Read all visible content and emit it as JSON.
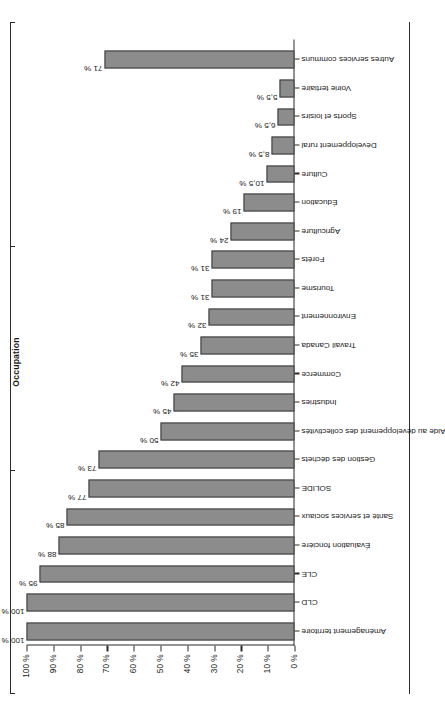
{
  "chart_data": {
    "type": "bar",
    "title": "Occupation",
    "xlabel": "",
    "ylabel": "",
    "ylim": [
      0,
      100
    ],
    "grid": false,
    "legend": "none",
    "orientation": "vertical-bars-on-rotated-page",
    "value_suffix": " %",
    "ytick_labels": [
      "0 %",
      "10 %",
      "20 %",
      "30 %",
      "40 %",
      "50 %",
      "60 %",
      "70 %",
      "80 %",
      "90 %",
      "100 %"
    ],
    "ytick_values": [
      0,
      10,
      20,
      30,
      40,
      50,
      60,
      70,
      80,
      90,
      100
    ],
    "categories": [
      "Aménagement territoire",
      "CLD",
      "CLE",
      "Évaluation foncière",
      "Santé et services sociaux",
      "SOLIDE",
      "Gestion des déchets",
      "Aide au développement des collectivités",
      "Industries",
      "Commerce",
      "Travail Canada",
      "Environnement",
      "Tourisme",
      "Forêts",
      "Agriculture",
      "Éducation",
      "Culture",
      "Développement rural",
      "Sports et loisirs",
      "Voirie tertiaire",
      "Autres services communs"
    ],
    "values": [
      100,
      100,
      95,
      88,
      85,
      77,
      73,
      50,
      45,
      42,
      35,
      32,
      31,
      31,
      24,
      19,
      10.5,
      8.5,
      6.5,
      5.5,
      71
    ],
    "value_labels": [
      "100 %",
      "100 %",
      "95 %",
      "88 %",
      "85 %",
      "77 %",
      "73 %",
      "50 %",
      "45 %",
      "42 %",
      "35 %",
      "32 %",
      "31 %",
      "31 %",
      "24 %",
      "19 %",
      "10,5 %",
      "8,5 %",
      "6,5 %",
      "5,5 %",
      "71 %"
    ],
    "colors": {
      "bar_fill": "#8c8c8c",
      "bar_border": "#3a3a3a",
      "axis": "#2b2b2b",
      "text": "#1a1a1a",
      "background": "#ffffff"
    }
  }
}
